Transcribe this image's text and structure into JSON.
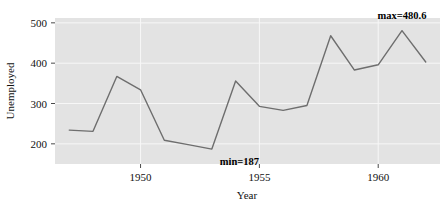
{
  "chart_data": {
    "type": "line",
    "title": "",
    "xlabel": "Year",
    "ylabel": "Unemployed",
    "x": [
      1947,
      1948,
      1949,
      1950,
      1951,
      1952,
      1953,
      1954,
      1955,
      1956,
      1957,
      1958,
      1959,
      1960,
      1961,
      1962
    ],
    "values": [
      234,
      231,
      367,
      334,
      209,
      198,
      187,
      356,
      293,
      283,
      295,
      468,
      383,
      396,
      480.6,
      403
    ],
    "series": [
      {
        "name": "Unemployed",
        "values": [
          234,
          231,
          367,
          334,
          209,
          198,
          187,
          356,
          293,
          283,
          295,
          468,
          383,
          396,
          480.6,
          403
        ]
      }
    ],
    "xlim": [
      1946.4,
      1962.6
    ],
    "ylim": [
      150,
      512
    ],
    "xticks": [
      1950,
      1955,
      1960
    ],
    "xtick_labels": [
      "1950",
      "1955",
      "1960"
    ],
    "yticks": [
      200,
      300,
      400,
      500
    ],
    "ytick_labels": [
      "200",
      "300",
      "400",
      "500"
    ],
    "grid": true,
    "legend": "none",
    "panel_color": "#e3e3e3",
    "grid_color": "#f7f7f7",
    "line_color": "#6e6e6e",
    "annotations": [
      {
        "name": "min-annotation",
        "text": "min=187",
        "x": 1953,
        "y": 187,
        "label_dx": 8,
        "label_dy": 16,
        "anchor": "start"
      },
      {
        "name": "max-annotation",
        "text": "max=480.6",
        "x": 1961,
        "y": 480.6,
        "label_dx": 0,
        "label_dy": -12,
        "anchor": "middle"
      }
    ]
  }
}
